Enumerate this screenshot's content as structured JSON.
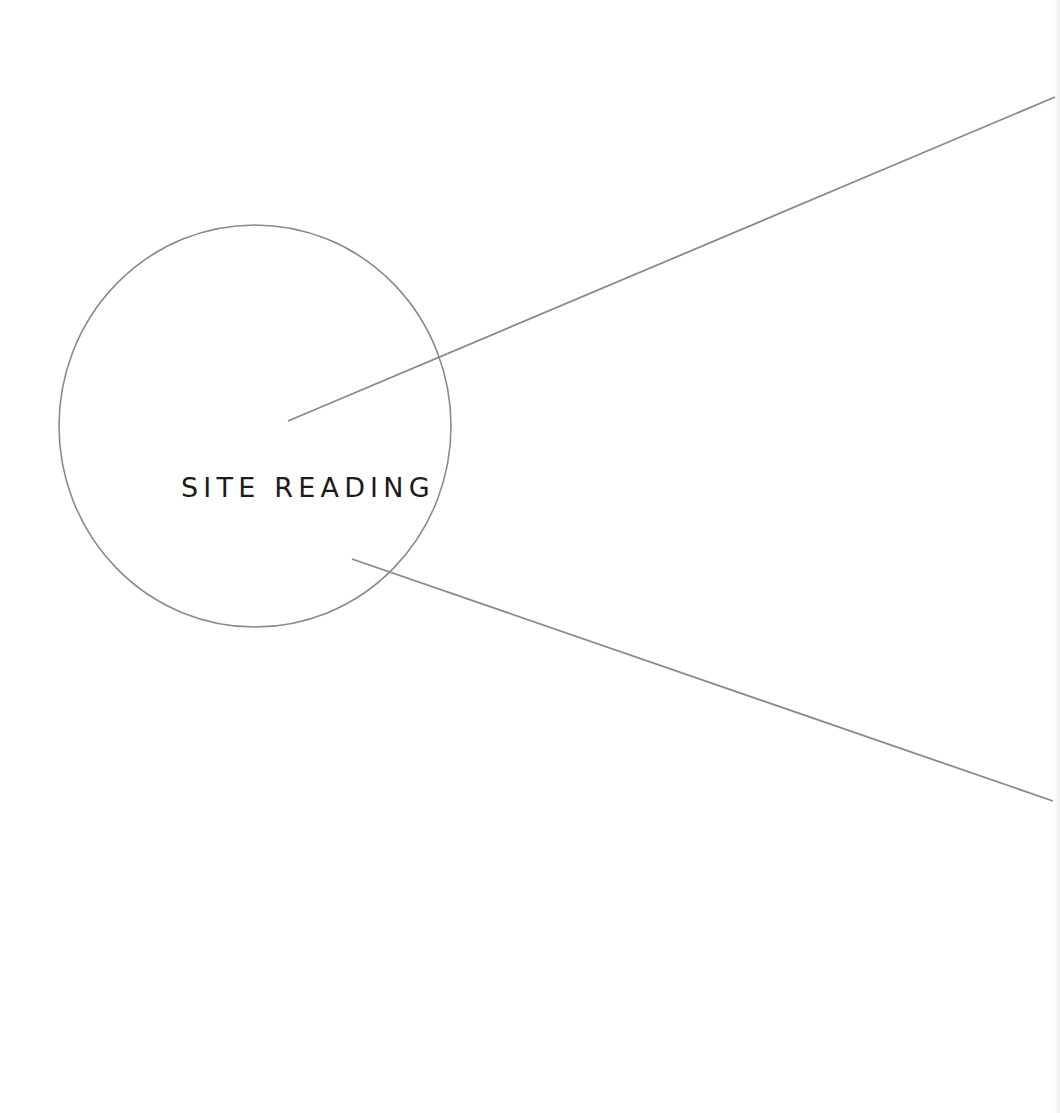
{
  "title": "SITE READING",
  "colors": {
    "background": "#ffffff",
    "text": "#1c1c1c",
    "stroke": "#8a8a8a"
  },
  "shapes": {
    "circle": {
      "cx": 255,
      "cy": 426,
      "rx": 196,
      "ry": 201
    },
    "line_upper": {
      "x1": 288,
      "y1": 421,
      "x2": 1055,
      "y2": 97
    },
    "line_lower": {
      "x1": 352,
      "y1": 559,
      "x2": 1053,
      "y2": 801
    }
  }
}
